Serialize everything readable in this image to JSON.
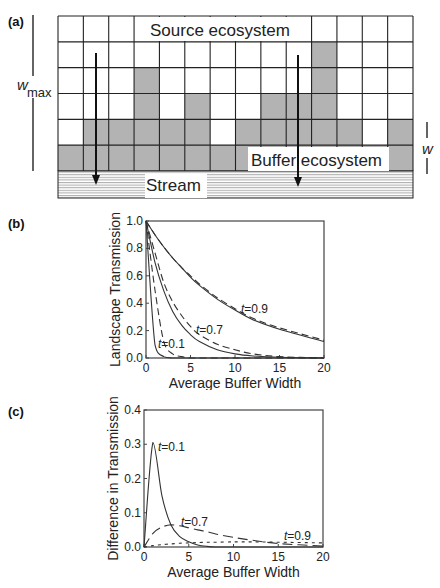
{
  "panels": {
    "a": {
      "label": "(a)",
      "source_label": "Source ecosystem",
      "buffer_label": "Buffer ecosystem",
      "stream_label": "Stream",
      "wmax_label": "w",
      "wmax_sub": "max",
      "w_label": "w",
      "grid": {
        "columns": 14,
        "rows": 6
      },
      "buffer_heights": [
        1,
        2,
        2,
        4,
        2,
        3,
        1,
        2,
        3,
        3,
        5,
        2,
        1,
        2
      ],
      "colors": {
        "buffer_fill": "#b3b3b3",
        "grid_line": "#222222",
        "stream_line": "#999999"
      }
    },
    "b": {
      "label": "(b)"
    },
    "c": {
      "label": "(c)"
    }
  },
  "chart_data": [
    {
      "panel": "(b)",
      "type": "line",
      "title": "",
      "xlabel": "Average Buffer Width",
      "ylabel": "Landscape Transmission",
      "xlim": [
        0,
        20
      ],
      "ylim": [
        0,
        1.0
      ],
      "xticks": [
        "0",
        "5",
        "10",
        "15",
        "20"
      ],
      "yticks": [
        "0.0",
        "0.2",
        "0.4",
        "0.6",
        "0.8",
        "1.0"
      ],
      "grid": false,
      "annotations": [
        "t=0.1",
        "t=0.7",
        "t=0.9"
      ],
      "x": [
        0,
        1,
        2,
        3,
        4,
        5,
        6,
        8,
        10,
        12,
        15,
        20
      ],
      "series": [
        {
          "name": "t=0.1 solid",
          "style": "solid",
          "values": [
            1.0,
            0.1,
            0.01,
            0.0,
            0.0,
            0.0,
            0.0,
            0.0,
            0.0,
            0.0,
            0.0,
            0.0
          ]
        },
        {
          "name": "t=0.1 dashed",
          "style": "dashed",
          "values": [
            1.0,
            0.5,
            0.12,
            0.03,
            0.01,
            0.0,
            0.0,
            0.0,
            0.0,
            0.0,
            0.0,
            0.0
          ]
        },
        {
          "name": "t=0.7 solid",
          "style": "solid",
          "values": [
            1.0,
            0.7,
            0.49,
            0.34,
            0.24,
            0.17,
            0.12,
            0.06,
            0.03,
            0.015,
            0.005,
            0.0
          ]
        },
        {
          "name": "t=0.7 dashed",
          "style": "dashed",
          "values": [
            1.0,
            0.77,
            0.55,
            0.41,
            0.31,
            0.23,
            0.17,
            0.1,
            0.06,
            0.03,
            0.01,
            0.0
          ]
        },
        {
          "name": "t=0.9 solid",
          "style": "solid",
          "values": [
            1.0,
            0.9,
            0.81,
            0.73,
            0.66,
            0.59,
            0.53,
            0.43,
            0.35,
            0.28,
            0.21,
            0.12
          ]
        },
        {
          "name": "t=0.9 dashed",
          "style": "dashed",
          "values": [
            1.0,
            0.9,
            0.81,
            0.73,
            0.66,
            0.6,
            0.54,
            0.44,
            0.36,
            0.29,
            0.22,
            0.13
          ]
        }
      ]
    },
    {
      "panel": "(c)",
      "type": "line",
      "title": "",
      "xlabel": "Average Buffer Width",
      "ylabel": "Difference in Transmission",
      "xlim": [
        0,
        20
      ],
      "ylim": [
        0,
        0.4
      ],
      "xticks": [
        "0",
        "5",
        "10",
        "15",
        "20"
      ],
      "yticks": [
        "0.0",
        "0.1",
        "0.2",
        "0.3",
        "0.4"
      ],
      "grid": false,
      "annotations": [
        "t=0.1",
        "t=0.7",
        "t=0.9"
      ],
      "x": [
        0,
        1,
        2,
        3,
        4,
        5,
        6,
        7,
        8,
        10,
        12,
        15,
        20
      ],
      "series": [
        {
          "name": "t=0.1",
          "style": "solid",
          "values": [
            0.0,
            0.305,
            0.15,
            0.065,
            0.03,
            0.015,
            0.006,
            0.002,
            0.0,
            0.0,
            0.0,
            0.0,
            0.0
          ]
        },
        {
          "name": "t=0.7",
          "style": "long-dash",
          "values": [
            0.0,
            0.04,
            0.058,
            0.065,
            0.062,
            0.056,
            0.05,
            0.045,
            0.038,
            0.028,
            0.02,
            0.01,
            0.003
          ]
        },
        {
          "name": "t=0.9",
          "style": "short-dash",
          "values": [
            0.0,
            0.004,
            0.007,
            0.009,
            0.011,
            0.012,
            0.013,
            0.014,
            0.014,
            0.015,
            0.015,
            0.014,
            0.012
          ]
        }
      ]
    }
  ]
}
